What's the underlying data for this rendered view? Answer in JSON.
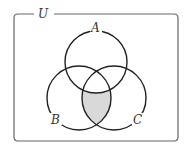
{
  "universe_label": "U",
  "sets": [
    {
      "label": "A",
      "cx": 96,
      "cy": 62,
      "r": 31
    },
    {
      "label": "B",
      "cx": 79,
      "cy": 98,
      "r": 32
    },
    {
      "label": "C",
      "cx": 114,
      "cy": 98,
      "r": 32
    }
  ],
  "shaded_region": "(B ∩ C) \\ A",
  "colors": {
    "stroke": "#222222",
    "shade": "#d9d9d9",
    "box": "#666666"
  }
}
